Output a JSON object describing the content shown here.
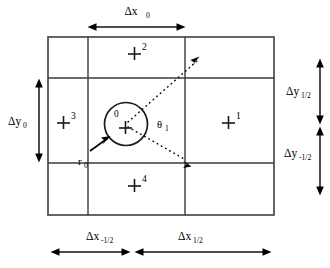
{
  "figure": {
    "background_color": "#ffffff",
    "line_color": "#3a3a3a",
    "ink_color": "#000000"
  },
  "dimensions": {
    "top": {
      "name": "delta-x-0",
      "symbol": "Δx",
      "subscript": "0",
      "label": "Δx₀"
    },
    "left": {
      "name": "delta-y-0",
      "symbol": "Δy",
      "subscript": "0",
      "label": "Δy₀"
    },
    "right_upper": {
      "name": "delta-y-half",
      "symbol": "Δy",
      "subscript": "1/2",
      "label": "Δy₁⁄₂"
    },
    "right_lower": {
      "name": "delta-y-minus-half",
      "symbol": "Δy",
      "subscript": "-1/2",
      "label": "Δy₋₁⁄₂"
    },
    "bottom_left": {
      "name": "delta-x-minus-half",
      "symbol": "Δx",
      "subscript": "-1/2",
      "label": "Δx₋₁⁄₂"
    },
    "bottom_right": {
      "name": "delta-x-half",
      "symbol": "Δx",
      "subscript": "1/2",
      "label": "Δx₁⁄₂"
    }
  },
  "cells": [
    {
      "id": "center",
      "marker": "+",
      "number": "0",
      "position": "center",
      "number_placement": "upper-left-inside-circle"
    },
    {
      "id": "east",
      "marker": "+",
      "number": "1",
      "position": "right-middle",
      "number_placement": "superscript"
    },
    {
      "id": "north",
      "marker": "+",
      "number": "2",
      "position": "top-middle",
      "number_placement": "superscript"
    },
    {
      "id": "west",
      "marker": "+",
      "number": "3",
      "position": "left-middle",
      "number_placement": "superscript"
    },
    {
      "id": "south",
      "marker": "+",
      "number": "4",
      "position": "bottom-middle",
      "number_placement": "superscript"
    }
  ],
  "annotations": {
    "radius": {
      "name": "radius-r0",
      "symbol": "r",
      "subscript": "0",
      "label": "r₀",
      "description": "arrow pointing to circle boundary"
    },
    "angle": {
      "name": "angle-theta1",
      "symbol": "θ",
      "subscript": "1",
      "label": "θ₁",
      "description": "angular sector between two dotted rays"
    }
  },
  "geometry": {
    "grid": {
      "x_lines": [
        48,
        88,
        185,
        274
      ],
      "y_lines": [
        37,
        78,
        163,
        215
      ],
      "columns": 3,
      "rows": 3
    },
    "circle": {
      "cx": 126,
      "cy": 124,
      "r": 21.5
    },
    "rays": [
      {
        "name": "upper-ray",
        "from": [
          126,
          124
        ],
        "to": [
          201,
          57
        ],
        "arrow": "up-right"
      },
      {
        "name": "lower-ray",
        "from": [
          126,
          124
        ],
        "to": [
          189,
          162
        ],
        "arrow": "down-right"
      }
    ]
  }
}
